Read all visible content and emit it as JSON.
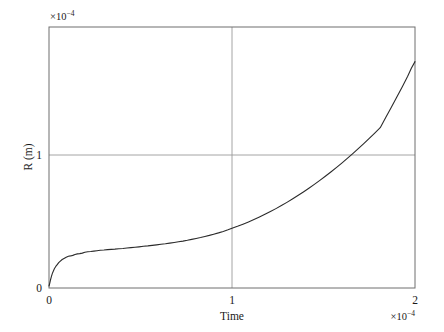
{
  "chart_data": {
    "type": "line",
    "title": "",
    "xlabel": "Time",
    "ylabel": "R (m)",
    "x_multiplier": "×10",
    "x_multiplier_exp": "−4",
    "y_multiplier": "×10",
    "y_multiplier_exp": "−4",
    "xlim": [
      0,
      2
    ],
    "ylim": [
      0,
      1.96
    ],
    "xticks": [
      0,
      1,
      2
    ],
    "xticklabels": [
      "0",
      "1",
      "2"
    ],
    "yticks": [
      0,
      1
    ],
    "yticklabels": [
      "0",
      "1"
    ],
    "grid": true,
    "grid_color": "#9a9a9a",
    "legend": "none",
    "line_color": "#2b2b2b",
    "line_width": 1.1,
    "background": "#ffffff",
    "axes_color": "#6e6e6e",
    "series": [
      {
        "name": "R",
        "x": [
          0.0,
          0.004,
          0.008,
          0.013,
          0.018,
          0.024,
          0.03,
          0.037,
          0.045,
          0.053,
          0.062,
          0.072,
          0.082,
          0.094,
          0.106,
          0.118,
          0.13,
          0.142,
          0.155,
          0.168,
          0.182,
          0.196,
          0.212,
          0.228,
          0.245,
          0.262,
          0.28,
          0.3,
          0.32,
          0.34,
          0.36,
          0.382,
          0.404,
          0.426,
          0.448,
          0.47,
          0.492,
          0.516,
          0.54,
          0.564,
          0.588,
          0.612,
          0.636,
          0.66,
          0.684,
          0.708,
          0.732,
          0.756,
          0.78,
          0.804,
          0.828,
          0.852,
          0.876,
          0.9,
          0.926,
          0.952,
          0.978,
          1.0,
          1.03,
          1.06,
          1.09,
          1.12,
          1.15,
          1.18,
          1.21,
          1.24,
          1.27,
          1.3,
          1.33,
          1.36,
          1.39,
          1.42,
          1.45,
          1.48,
          1.51,
          1.54,
          1.57,
          1.6,
          1.63,
          1.66,
          1.69,
          1.72,
          1.75,
          1.78,
          1.81,
          1.84,
          1.87,
          1.9,
          1.93,
          1.96,
          1.98,
          2.0
        ],
        "y": [
          0.015,
          0.035,
          0.06,
          0.085,
          0.108,
          0.128,
          0.146,
          0.162,
          0.176,
          0.19,
          0.202,
          0.214,
          0.222,
          0.231,
          0.238,
          0.241,
          0.245,
          0.252,
          0.256,
          0.258,
          0.262,
          0.268,
          0.272,
          0.274,
          0.277,
          0.28,
          0.283,
          0.285,
          0.288,
          0.29,
          0.292,
          0.295,
          0.297,
          0.3,
          0.303,
          0.306,
          0.309,
          0.313,
          0.316,
          0.32,
          0.324,
          0.328,
          0.332,
          0.337,
          0.342,
          0.347,
          0.352,
          0.358,
          0.365,
          0.372,
          0.379,
          0.387,
          0.395,
          0.404,
          0.414,
          0.425,
          0.437,
          0.448,
          0.463,
          0.479,
          0.496,
          0.514,
          0.533,
          0.553,
          0.574,
          0.596,
          0.619,
          0.643,
          0.668,
          0.694,
          0.721,
          0.749,
          0.778,
          0.808,
          0.839,
          0.871,
          0.904,
          0.938,
          0.973,
          1.009,
          1.046,
          1.084,
          1.123,
          1.163,
          1.204,
          1.28,
          1.355,
          1.432,
          1.51,
          1.59,
          1.65,
          1.7
        ]
      }
    ]
  },
  "axis": {
    "x_label": "Time",
    "y_label": "R (m)",
    "x_tick_0": "0",
    "x_tick_1": "1",
    "x_tick_2": "2",
    "y_tick_0": "0",
    "y_tick_1": "1",
    "x_exp_base": "×10",
    "x_exp_power": "−4",
    "y_exp_base": "×10",
    "y_exp_power": "−4"
  }
}
